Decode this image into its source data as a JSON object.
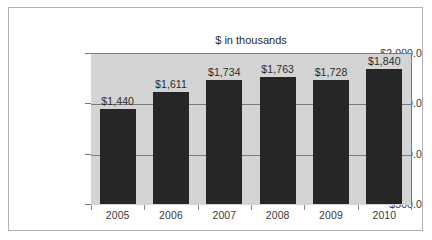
{
  "chart_data": {
    "type": "bar",
    "title": "$ in thousands",
    "xlabel": "",
    "ylabel": "",
    "categories": [
      "2005",
      "2006",
      "2007",
      "2008",
      "2009",
      "2010"
    ],
    "values": [
      1440,
      1611,
      1734,
      1763,
      1728,
      1840
    ],
    "data_labels": [
      "$1,440",
      "$1,611",
      "$1,734",
      "$1,763",
      "$1,728",
      "$1,840"
    ],
    "ylim": [
      500,
      2000
    ],
    "ytick_values": [
      500,
      1000,
      1500,
      2000
    ],
    "ytick_labels": [
      "$500.0",
      "$1,000.0",
      "$1,500.0",
      "$2,000.0"
    ],
    "grid": true,
    "legend": false,
    "legend_position": "none",
    "colors": {
      "bar": "#262626",
      "plot_background": "#d4d4d4",
      "canvas_background": "#ffffff",
      "gridline": "#7a7a7a",
      "frame_border": "#b0b0b0",
      "text": "#2b2b2b"
    }
  }
}
